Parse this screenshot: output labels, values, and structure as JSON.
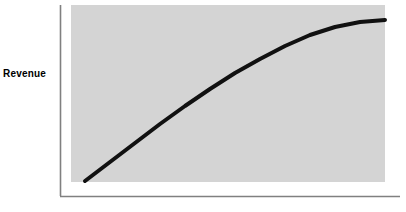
{
  "figure": {
    "width": 406,
    "height": 212,
    "background_color": "#ffffff"
  },
  "axis_label_y": "Revenue",
  "style": {
    "panel_color": "#d4d4d4",
    "axis_color": "#808080",
    "curve_color": "#111111",
    "label_color": "#000000",
    "curve_width": 4
  },
  "chart_data": {
    "type": "line",
    "title": "",
    "xlabel": "",
    "ylabel": "Revenue",
    "grid": false,
    "legend": false,
    "xlim": [
      0,
      100
    ],
    "ylim": [
      0,
      100
    ],
    "axis_tick_labels_x": [],
    "axis_tick_labels_y": [],
    "series": [
      {
        "name": "Revenue",
        "x": [
          0,
          5,
          10,
          15,
          20,
          25,
          30,
          35,
          40,
          45,
          50,
          55,
          60,
          65,
          70,
          75,
          80,
          85,
          90,
          95,
          100
        ],
        "y": [
          1,
          5,
          10,
          15,
          20,
          26,
          32,
          38,
          44,
          50,
          56,
          62,
          68,
          73,
          78,
          83,
          87,
          90,
          92,
          93,
          94
        ]
      }
    ]
  },
  "geometry": {
    "panel": {
      "x": 71,
      "y": 5,
      "width": 314,
      "height": 177
    },
    "y_axis": {
      "x": 60,
      "y_top": 5,
      "y_bottom": 196
    },
    "x_axis": {
      "y": 196,
      "x_left": 60,
      "x_right": 400
    },
    "curve_points": "85,181 110,162 135,143 160,124 185,106 210,89 235,73 260,59 285,46 310,35 335,27 360,22 385,20"
  }
}
